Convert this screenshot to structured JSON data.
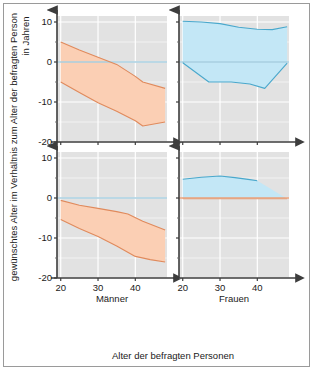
{
  "figure": {
    "background": "#ffffff",
    "border_color": "#9a9a9a",
    "panel_background": "#e2e2e2",
    "gridline_color": "#ffffff",
    "axis_color": "#4a4a4a"
  },
  "axis_titles": {
    "x": "Alter der befragten Personen",
    "y_line1": "gewünschtes Alter im Verhältnis zum Alter der befragten Person",
    "y_line2": "in Jahren"
  },
  "colors": {
    "orange_fill": "#fbcfb4",
    "orange_line": "#e08a5c",
    "blue_fill": "#c3e7f6",
    "blue_line": "#4aa8cc",
    "zero_line_blue": "#a8cfe0",
    "zero_line_orange": "#e8a07a"
  },
  "ticks": {
    "y_labels": [
      "10",
      "0",
      "-10",
      "-20"
    ],
    "y_values": [
      10,
      0,
      -10,
      -20
    ],
    "x_labels": [
      "20",
      "30",
      "40"
    ],
    "x_values": [
      20,
      30,
      40
    ]
  },
  "panel_labels": {
    "men": "Männer",
    "women": "Frauen"
  },
  "chart_data": {
    "type": "area",
    "title": "",
    "xlabel": "Alter der befragten Personen",
    "ylabel": "gewünschtes Alter im Verhältnis zum Alter der befragten Person in Jahren",
    "xlim": [
      19,
      48.5
    ],
    "ylim": [
      -20,
      11.5
    ],
    "grid": true,
    "legend_position": "none",
    "panels": [
      {
        "id": "top-left",
        "row": 0,
        "col": 0,
        "group_label": "Männer",
        "series": [
          {
            "name": "Männer oben (Obergrenze)",
            "color": "#e08a5c",
            "x": [
              20,
              25,
              30,
              35,
              40,
              42,
              48
            ],
            "values": [
              5.0,
              3.0,
              1.2,
              -0.6,
              -3.6,
              -5.0,
              -6.6
            ]
          },
          {
            "name": "Männer oben (Untergrenze)",
            "color": "#e08a5c",
            "x": [
              20,
              25,
              30,
              35,
              40,
              42,
              48
            ],
            "values": [
              -5.0,
              -7.6,
              -10.2,
              -12.3,
              -14.7,
              -16.0,
              -15.0
            ]
          }
        ],
        "fill": {
          "color": "#fbcfb4",
          "between": [
            "Männer oben (Obergrenze)",
            "Männer oben (Untergrenze)"
          ]
        }
      },
      {
        "id": "top-right",
        "row": 0,
        "col": 1,
        "group_label": "Frauen",
        "series": [
          {
            "name": "Frauen oben (Obergrenze)",
            "color": "#4aa8cc",
            "x": [
              20,
              25,
              30,
              35,
              40,
              44,
              48
            ],
            "values": [
              10.2,
              10.0,
              9.6,
              8.7,
              8.2,
              8.1,
              8.8
            ]
          },
          {
            "name": "Frauen oben (Untergrenze)",
            "color": "#4aa8cc",
            "x": [
              20,
              27,
              33,
              38,
              42,
              48
            ],
            "values": [
              -0.2,
              -5.0,
              -5.0,
              -5.5,
              -6.6,
              -0.3
            ]
          }
        ],
        "fill": {
          "color": "#c3e7f6",
          "between": [
            "Frauen oben (Obergrenze)",
            "Frauen oben (Untergrenze)"
          ]
        }
      },
      {
        "id": "bottom-left",
        "row": 1,
        "col": 0,
        "group_label": "Männer",
        "series": [
          {
            "name": "Männer unten (Obergrenze)",
            "color": "#e08a5c",
            "x": [
              20,
              25,
              30,
              35,
              38,
              42,
              48
            ],
            "values": [
              -0.6,
              -1.8,
              -2.6,
              -3.4,
              -4.0,
              -5.8,
              -8.0
            ]
          },
          {
            "name": "Männer unten (Untergrenze)",
            "color": "#e08a5c",
            "x": [
              20,
              25,
              30,
              35,
              40,
              44,
              48
            ],
            "values": [
              -5.4,
              -7.6,
              -9.6,
              -12.0,
              -14.6,
              -15.4,
              -16.0
            ]
          }
        ],
        "fill": {
          "color": "#fbcfb4",
          "between": [
            "Männer unten (Obergrenze)",
            "Männer unten (Untergrenze)"
          ]
        }
      },
      {
        "id": "bottom-right",
        "row": 1,
        "col": 1,
        "group_label": "Frauen",
        "series": [
          {
            "name": "Frauen unten (Obergrenze)",
            "color": "#4aa8cc",
            "x": [
              20,
              25,
              30,
              34,
              38,
              40
            ],
            "values": [
              4.7,
              5.2,
              5.5,
              5.1,
              4.6,
              4.3
            ]
          },
          {
            "name": "Frauen unten (Untergrenze)",
            "color": "#e8a07a",
            "x": [
              20,
              30,
              40,
              48
            ],
            "values": [
              -0.2,
              -0.2,
              -0.2,
              -0.2
            ]
          }
        ],
        "fill": {
          "color": "#c3e7f6",
          "between": [
            "Frauen unten (Obergrenze)",
            "Frauen unten (Untergrenze)"
          ]
        }
      }
    ]
  }
}
